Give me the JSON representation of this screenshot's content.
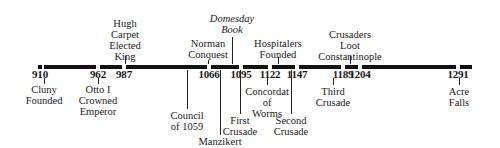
{
  "timeline": {
    "start_year": 910,
    "end_year": 1291,
    "bar_color": "#111111",
    "bar_x_start": 38,
    "bar_x_end": 472,
    "years": [
      {
        "year": "910",
        "x": 40
      },
      {
        "year": "962",
        "x": 98
      },
      {
        "year": "987",
        "x": 124
      },
      {
        "year": "1066",
        "x": 209
      },
      {
        "year": "1095",
        "x": 241
      },
      {
        "year": "1122",
        "x": 270
      },
      {
        "year": "1147",
        "x": 297
      },
      {
        "year": "1189",
        "x": 343
      },
      {
        "year": "1204",
        "x": 360
      },
      {
        "year": "1291",
        "x": 458
      }
    ],
    "events_above": [
      {
        "id": "hugh-capet",
        "lines": [
          "Hugh",
          "Carpet",
          "Elected",
          "King"
        ],
        "x": 125,
        "italic": false,
        "top": 18,
        "tick_top": 56,
        "tick_bottom": 64
      },
      {
        "id": "domesday-book",
        "lines": [
          "Domesday",
          "Book"
        ],
        "x": 232,
        "italic": true,
        "top": 13,
        "tick_top": 37,
        "tick_bottom": 64
      },
      {
        "id": "norman-conquest",
        "lines": [
          "Norman",
          "Conquest"
        ],
        "x": 208,
        "italic": false,
        "top": 38,
        "tick_top": 60,
        "tick_bottom": 64
      },
      {
        "id": "hospitalers-founded",
        "lines": [
          "Hospitalers",
          "Founded"
        ],
        "x": 278,
        "italic": false,
        "top": 38,
        "tick_top": 57,
        "tick_bottom": 64
      },
      {
        "id": "crusaders-loot-constantinople",
        "lines": [
          "Crusaders",
          "Loot",
          "Constantinople"
        ],
        "x": 350,
        "italic": false,
        "top": 29,
        "tick_top": 56,
        "tick_bottom": 64
      }
    ],
    "events_below": [
      {
        "id": "cluny-founded",
        "lines": [
          "Cluny",
          "Founded"
        ],
        "x": 44,
        "top": 84,
        "tick_top": 78,
        "tick_bottom": 84
      },
      {
        "id": "otto-crowned",
        "lines": [
          "Otto I",
          "Crowned",
          "Emperor"
        ],
        "x": 98,
        "top": 84,
        "tick_top": 78,
        "tick_bottom": 84
      },
      {
        "id": "council-1059",
        "lines": [
          "Council",
          "of 1059"
        ],
        "x": 187,
        "top": 110,
        "tick_top": 70,
        "tick_bottom": 109
      },
      {
        "id": "manzikert",
        "lines": [
          "Manzikert"
        ],
        "x": 220,
        "top": 136,
        "tick_top": 70,
        "tick_bottom": 135
      },
      {
        "id": "concordat-worms",
        "lines": [
          "Concordat",
          "of",
          "Worms"
        ],
        "x": 267,
        "top": 86,
        "tick_top": 78,
        "tick_bottom": 85
      },
      {
        "id": "first-crusade",
        "lines": [
          "First",
          "Crusade"
        ],
        "x": 240,
        "top": 115,
        "tick_top": 70,
        "tick_bottom": 114
      },
      {
        "id": "second-crusade",
        "lines": [
          "Second",
          "Crusade"
        ],
        "x": 291,
        "top": 115,
        "tick_top": 70,
        "tick_bottom": 114
      },
      {
        "id": "third-crusade",
        "lines": [
          "Third",
          "Crusade"
        ],
        "x": 333,
        "top": 86,
        "tick_top": 78,
        "tick_bottom": 85
      },
      {
        "id": "acre-falls",
        "lines": [
          "Acre",
          "Falls"
        ],
        "x": 459,
        "top": 86,
        "tick_top": 78,
        "tick_bottom": 85
      }
    ]
  }
}
